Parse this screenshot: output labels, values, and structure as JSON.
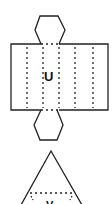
{
  "diagram": {
    "type": "net",
    "colors": {
      "stroke": "#222222",
      "background": "#ffffff"
    },
    "cylinder_net": {
      "label": "U",
      "top_cap": "hexagon",
      "body": "rectangle",
      "bottom_cap": "hexagon",
      "fold_lines": 5
    },
    "triangle_net": {
      "label": "V",
      "shape": "triangle",
      "fold_lines": 1
    }
  }
}
